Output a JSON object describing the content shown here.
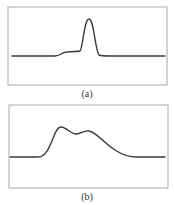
{
  "figure": {
    "panels": [
      {
        "id": "a",
        "caption": "(a)",
        "frame": {
          "x": 8,
          "y": 7,
          "width": 159,
          "height": 78
        },
        "curve_path": "M 12 56 L 55 56 C 60 56, 62 52, 67 52 C 72 51, 77 52, 80 51 C 83 48, 84 19, 89 19 C 94 19, 95 50, 99 55 C 101 56, 104 56, 110 56 L 165 56",
        "description": "Flat baseline with a small shoulder followed by a single sharp narrow peak"
      },
      {
        "id": "b",
        "caption": "(b)",
        "frame": {
          "x": 9,
          "y": 105,
          "width": 159,
          "height": 83
        },
        "curve_path": "M 10 157 L 38 157 C 46 157, 50 146, 54 136 C 57 128, 59 127, 61 127 C 66 127, 71 134, 76 134 C 80 134, 84 130, 89 131 C 96 132, 104 143, 115 150 C 124 156, 130 157, 137 157 L 165 157",
        "description": "Broad asymmetric profile with two overlapping humps and a long trailing tail"
      }
    ],
    "colors": {
      "frame": "#b8b8b8",
      "curve": "#3a3a3a",
      "background": "#ffffff",
      "caption": "#333333"
    }
  }
}
